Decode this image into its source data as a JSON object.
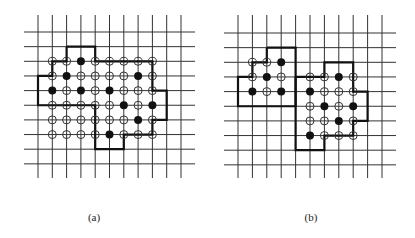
{
  "figure": {
    "colors": {
      "background": "#ffffff",
      "grid": "#333333",
      "boundary": "#111111",
      "open_circle_stroke": "#333333",
      "filled_circle": "#111111"
    },
    "panels": [
      {
        "id": "a",
        "label": "(a)",
        "grid": {
          "cols": 11,
          "rows": 10,
          "x0": 38,
          "dx": 14.3,
          "y0": 32,
          "dy": 14.65,
          "vline_top": 15,
          "vline_bottom": 178,
          "hline_left": 24,
          "hline_right": 195
        },
        "boundaries": [
          [
            [
              2,
              1
            ],
            [
              4,
              1
            ],
            [
              4,
              2
            ],
            [
              8,
              2
            ],
            [
              8,
              4
            ],
            [
              9,
              4
            ],
            [
              9,
              6
            ],
            [
              8,
              6
            ],
            [
              8,
              7
            ],
            [
              6,
              7
            ],
            [
              6,
              8
            ],
            [
              4,
              8
            ],
            [
              4,
              5
            ],
            [
              0,
              5
            ],
            [
              0,
              3
            ],
            [
              1,
              3
            ],
            [
              1,
              2
            ],
            [
              2,
              2
            ],
            [
              2,
              1
            ]
          ]
        ],
        "points": [
          {
            "r": 2,
            "c": 1,
            "f": 0
          },
          {
            "r": 2,
            "c": 2,
            "f": 0
          },
          {
            "r": 2,
            "c": 3,
            "f": 1
          },
          {
            "r": 2,
            "c": 4,
            "f": 0
          },
          {
            "r": 2,
            "c": 5,
            "f": 0
          },
          {
            "r": 2,
            "c": 6,
            "f": 0
          },
          {
            "r": 2,
            "c": 7,
            "f": 0
          },
          {
            "r": 2,
            "c": 8,
            "f": 0
          },
          {
            "r": 3,
            "c": 1,
            "f": 0
          },
          {
            "r": 3,
            "c": 2,
            "f": 1
          },
          {
            "r": 3,
            "c": 3,
            "f": 0
          },
          {
            "r": 3,
            "c": 4,
            "f": 0
          },
          {
            "r": 3,
            "c": 5,
            "f": 0
          },
          {
            "r": 3,
            "c": 6,
            "f": 0
          },
          {
            "r": 3,
            "c": 7,
            "f": 1
          },
          {
            "r": 3,
            "c": 8,
            "f": 0
          },
          {
            "r": 4,
            "c": 1,
            "f": 1
          },
          {
            "r": 4,
            "c": 2,
            "f": 0
          },
          {
            "r": 4,
            "c": 3,
            "f": 1
          },
          {
            "r": 4,
            "c": 4,
            "f": 0
          },
          {
            "r": 4,
            "c": 5,
            "f": 1
          },
          {
            "r": 4,
            "c": 6,
            "f": 0
          },
          {
            "r": 4,
            "c": 7,
            "f": 0
          },
          {
            "r": 4,
            "c": 8,
            "f": 0
          },
          {
            "r": 5,
            "c": 1,
            "f": 0
          },
          {
            "r": 5,
            "c": 2,
            "f": 0
          },
          {
            "r": 5,
            "c": 3,
            "f": 0
          },
          {
            "r": 5,
            "c": 4,
            "f": 0
          },
          {
            "r": 5,
            "c": 5,
            "f": 0
          },
          {
            "r": 5,
            "c": 6,
            "f": 1
          },
          {
            "r": 5,
            "c": 7,
            "f": 0
          },
          {
            "r": 5,
            "c": 8,
            "f": 1
          },
          {
            "r": 6,
            "c": 1,
            "f": 0
          },
          {
            "r": 6,
            "c": 2,
            "f": 0
          },
          {
            "r": 6,
            "c": 3,
            "f": 0
          },
          {
            "r": 6,
            "c": 4,
            "f": 0
          },
          {
            "r": 6,
            "c": 5,
            "f": 0
          },
          {
            "r": 6,
            "c": 6,
            "f": 0
          },
          {
            "r": 6,
            "c": 7,
            "f": 1
          },
          {
            "r": 6,
            "c": 8,
            "f": 0
          },
          {
            "r": 7,
            "c": 1,
            "f": 0
          },
          {
            "r": 7,
            "c": 2,
            "f": 0
          },
          {
            "r": 7,
            "c": 3,
            "f": 0
          },
          {
            "r": 7,
            "c": 4,
            "f": 0
          },
          {
            "r": 7,
            "c": 5,
            "f": 1
          },
          {
            "r": 7,
            "c": 6,
            "f": 0
          },
          {
            "r": 7,
            "c": 7,
            "f": 0
          },
          {
            "r": 7,
            "c": 8,
            "f": 0
          }
        ]
      },
      {
        "id": "b",
        "label": "(b)",
        "grid": {
          "cols": 11,
          "rows": 10,
          "x0": 238,
          "dx": 14.4,
          "y0": 33,
          "dy": 14.65,
          "vline_top": 15,
          "vline_bottom": 178,
          "hline_left": 224,
          "hline_right": 396
        },
        "boundaries": [
          [
            [
              2,
              1
            ],
            [
              4,
              1
            ],
            [
              4,
              5
            ],
            [
              0,
              5
            ],
            [
              0,
              3
            ],
            [
              1,
              3
            ],
            [
              1,
              2
            ],
            [
              2,
              2
            ],
            [
              2,
              1
            ]
          ],
          [
            [
              4,
              3
            ],
            [
              6,
              3
            ],
            [
              6,
              2
            ],
            [
              8,
              2
            ],
            [
              8,
              4
            ],
            [
              9,
              4
            ],
            [
              9,
              6
            ],
            [
              8,
              6
            ],
            [
              8,
              7
            ],
            [
              6,
              7
            ],
            [
              6,
              8
            ],
            [
              4,
              8
            ],
            [
              4,
              3
            ]
          ]
        ],
        "points": [
          {
            "r": 2,
            "c": 1,
            "f": 0
          },
          {
            "r": 2,
            "c": 2,
            "f": 0
          },
          {
            "r": 2,
            "c": 3,
            "f": 1
          },
          {
            "r": 3,
            "c": 1,
            "f": 0
          },
          {
            "r": 3,
            "c": 2,
            "f": 1
          },
          {
            "r": 3,
            "c": 3,
            "f": 0
          },
          {
            "r": 4,
            "c": 1,
            "f": 1
          },
          {
            "r": 4,
            "c": 2,
            "f": 0
          },
          {
            "r": 4,
            "c": 3,
            "f": 1
          },
          {
            "r": 3,
            "c": 5,
            "f": 0
          },
          {
            "r": 3,
            "c": 6,
            "f": 0
          },
          {
            "r": 3,
            "c": 7,
            "f": 1
          },
          {
            "r": 3,
            "c": 8,
            "f": 0
          },
          {
            "r": 4,
            "c": 5,
            "f": 1
          },
          {
            "r": 4,
            "c": 6,
            "f": 0
          },
          {
            "r": 4,
            "c": 7,
            "f": 0
          },
          {
            "r": 4,
            "c": 8,
            "f": 0
          },
          {
            "r": 5,
            "c": 5,
            "f": 0
          },
          {
            "r": 5,
            "c": 6,
            "f": 1
          },
          {
            "r": 5,
            "c": 7,
            "f": 0
          },
          {
            "r": 5,
            "c": 8,
            "f": 1
          },
          {
            "r": 6,
            "c": 5,
            "f": 0
          },
          {
            "r": 6,
            "c": 6,
            "f": 0
          },
          {
            "r": 6,
            "c": 7,
            "f": 1
          },
          {
            "r": 6,
            "c": 8,
            "f": 0
          },
          {
            "r": 7,
            "c": 5,
            "f": 1
          },
          {
            "r": 7,
            "c": 6,
            "f": 0
          },
          {
            "r": 7,
            "c": 7,
            "f": 0
          },
          {
            "r": 7,
            "c": 8,
            "f": 0
          }
        ]
      }
    ],
    "legend": {
      "filled_circle": "filled lattice point",
      "open_circle": "open lattice point",
      "thick_line": "region boundary"
    }
  }
}
